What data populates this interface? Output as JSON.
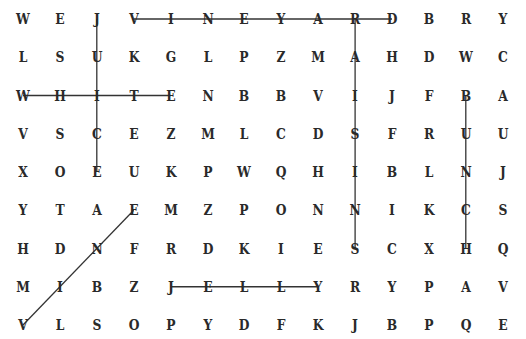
{
  "puzzle": {
    "columns": 14,
    "rows": 9,
    "grid": [
      [
        "W",
        "E",
        "J",
        "V",
        "I",
        "N",
        "E",
        "Y",
        "A",
        "R",
        "D",
        "B",
        "R",
        "Y"
      ],
      [
        "L",
        "S",
        "U",
        "K",
        "G",
        "L",
        "P",
        "Z",
        "M",
        "A",
        "H",
        "D",
        "W",
        "C"
      ],
      [
        "W",
        "H",
        "I",
        "T",
        "E",
        "N",
        "B",
        "B",
        "V",
        "I",
        "J",
        "F",
        "B",
        "A"
      ],
      [
        "V",
        "S",
        "C",
        "E",
        "Z",
        "M",
        "L",
        "C",
        "D",
        "S",
        "F",
        "R",
        "U",
        "U"
      ],
      [
        "X",
        "O",
        "E",
        "U",
        "K",
        "P",
        "W",
        "Q",
        "H",
        "I",
        "B",
        "L",
        "N",
        "J"
      ],
      [
        "Y",
        "T",
        "A",
        "E",
        "M",
        "Z",
        "P",
        "O",
        "N",
        "N",
        "I",
        "K",
        "C",
        "S"
      ],
      [
        "H",
        "D",
        "N",
        "F",
        "R",
        "D",
        "K",
        "I",
        "E",
        "S",
        "C",
        "X",
        "H",
        "Q"
      ],
      [
        "M",
        "I",
        "B",
        "Z",
        "J",
        "E",
        "L",
        "L",
        "Y",
        "R",
        "Y",
        "P",
        "A",
        "V"
      ],
      [
        "V",
        "L",
        "S",
        "O",
        "P",
        "Y",
        "D",
        "F",
        "K",
        "J",
        "B",
        "P",
        "Q",
        "E"
      ]
    ],
    "found_words": [
      {
        "word": "VINEYARD",
        "start": [
          0,
          3
        ],
        "end": [
          0,
          10
        ]
      },
      {
        "word": "JUICE",
        "start": [
          0,
          2
        ],
        "end": [
          4,
          2
        ]
      },
      {
        "word": "WHITE",
        "start": [
          2,
          0
        ],
        "end": [
          2,
          4
        ]
      },
      {
        "word": "RAISINS",
        "start": [
          0,
          9
        ],
        "end": [
          6,
          9
        ]
      },
      {
        "word": "BUNCH",
        "start": [
          2,
          12
        ],
        "end": [
          6,
          12
        ]
      },
      {
        "word": "JELLY",
        "start": [
          7,
          4
        ],
        "end": [
          7,
          8
        ]
      },
      {
        "word": "VINE",
        "start": [
          8,
          0
        ],
        "end": [
          5,
          3
        ]
      }
    ],
    "line_color": "#333333",
    "letter_color": "#2a2a2a"
  }
}
